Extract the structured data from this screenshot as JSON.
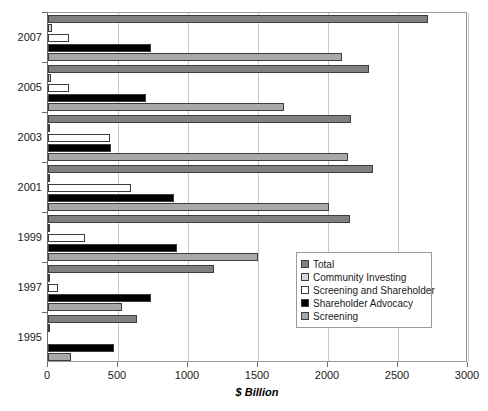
{
  "chart_data": {
    "type": "bar",
    "orientation": "horizontal",
    "title": "",
    "xlabel": "$ Billion",
    "ylabel": "",
    "xlim": [
      0,
      3000
    ],
    "xticks": [
      0,
      500,
      1000,
      1500,
      2000,
      2500,
      3000
    ],
    "xtick_labels": [
      "0",
      "500",
      "1000",
      "1500",
      "2000",
      "2500",
      "3000"
    ],
    "grid": true,
    "grid_axis": "x",
    "legend_position": "center-right",
    "categories": [
      "1995",
      "1997",
      "1999",
      "2001",
      "2003",
      "2005",
      "2007"
    ],
    "series": [
      {
        "name": "Total",
        "color": "#808080",
        "values": [
          639,
          1185,
          2159,
          2323,
          2164,
          2290,
          2711
        ]
      },
      {
        "name": "Community Investing",
        "color": "#d4d4d4",
        "values": [
          4,
          4,
          5,
          8,
          14,
          20,
          26
        ]
      },
      {
        "name": "Screening and Shareholder",
        "color": "#ffffff",
        "values": [
          0,
          72,
          265,
          592,
          441,
          151,
          151
        ]
      },
      {
        "name": "Shareholder Advocacy",
        "color": "#000000",
        "values": [
          473,
          736,
          922,
          897,
          448,
          703,
          739
        ]
      },
      {
        "name": "Screening",
        "color": "#a8a8a8",
        "values": [
          162,
          529,
          1497,
          2010,
          2143,
          1685,
          2098
        ]
      }
    ]
  }
}
